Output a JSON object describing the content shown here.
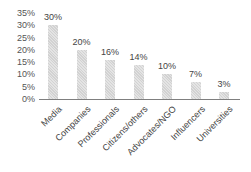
{
  "chart_data": {
    "type": "bar",
    "title": "",
    "xlabel": "",
    "ylabel": "",
    "categories": [
      "Media",
      "Companies",
      "Professionals",
      "Citizens/others",
      "Advocates/NGO",
      "Influencers",
      "Universities"
    ],
    "values": [
      30,
      20,
      16,
      14,
      10,
      7,
      3
    ],
    "value_labels": [
      "30%",
      "20%",
      "16%",
      "14%",
      "10%",
      "7%",
      "3%"
    ],
    "yticks": [
      "0%",
      "5%",
      "10%",
      "15%",
      "20%",
      "25%",
      "30%",
      "35%"
    ],
    "ylim": [
      0,
      35
    ],
    "grid": false,
    "legend": null,
    "bar_color": "#d9d9d9"
  }
}
